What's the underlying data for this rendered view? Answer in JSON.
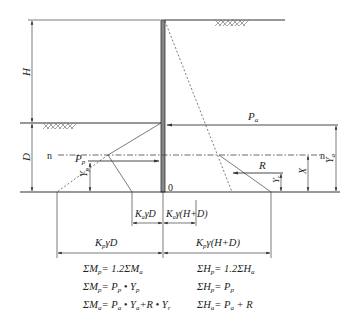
{
  "diagram": {
    "type": "sheet-pile-wall-earth-pressure",
    "labels": {
      "H": "H",
      "D": "D",
      "X": "X",
      "n_left": "n",
      "n_right": "n",
      "origin": "0",
      "Pa": "P",
      "Pa_sub": "a",
      "Pp": "P",
      "Pp_sub": "p",
      "R": "R",
      "Ya": "Y",
      "Ya_sub": "a",
      "Yp": "Y",
      "Yp_sub": "p",
      "Yr": "Y",
      "Yr_sub": "r"
    },
    "dimensions": {
      "ka_gamma_d": {
        "K": "K",
        "sub": "a",
        "rest": "γD"
      },
      "ka_gamma_hd": {
        "K": "K",
        "sub": "a",
        "rest": "γ(H+D)"
      },
      "kp_gamma_d": {
        "K": "K",
        "sub": "p",
        "rest": "γD"
      },
      "kp_gamma_hd": {
        "K": "K",
        "sub": "p",
        "rest": "γ(H+D)"
      }
    },
    "equations_left": [
      {
        "lhs": "ΣM",
        "lhs_sub": "p",
        "rhs": "= 1.2ΣM",
        "rhs_sub": "a",
        "tail": ""
      },
      {
        "lhs": "ΣM",
        "lhs_sub": "p",
        "rhs": "= P",
        "rhs_sub": "p",
        "tail": " • Y",
        "tail_sub": "p"
      },
      {
        "lhs": "ΣM",
        "lhs_sub": "a",
        "rhs": "= P",
        "rhs_sub": "a",
        "tail": " • Y",
        "tail_sub": "a",
        "tail2": "+R • Y",
        "tail2_sub": "r"
      }
    ],
    "equations_right": [
      {
        "lhs": "ΣH",
        "lhs_sub": "p",
        "rhs": "= 1.2ΣH",
        "rhs_sub": "a"
      },
      {
        "lhs": "ΣH",
        "lhs_sub": "p",
        "rhs": "= P",
        "rhs_sub": "p"
      },
      {
        "lhs": "ΣH",
        "lhs_sub": "a",
        "rhs": "= P",
        "rhs_sub": "a",
        "tail": " + R"
      }
    ],
    "colors": {
      "line": "#333333",
      "wall_fill": "#888888",
      "background": "#ffffff"
    }
  }
}
